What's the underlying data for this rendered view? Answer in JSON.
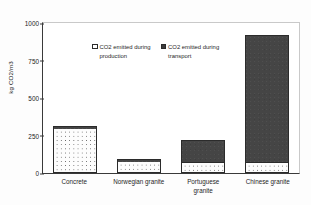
{
  "chart_data": {
    "type": "bar",
    "subtype": "stacked-vertical",
    "title": "",
    "xlabel": "",
    "ylabel": "kg CO2/m3",
    "ylim": [
      0,
      1000
    ],
    "yticks": [
      0,
      250,
      500,
      750,
      1000
    ],
    "ytick_labels": [
      "0",
      "250",
      "500",
      "750",
      "1000"
    ],
    "grid": false,
    "legend_position": "inside-top-left",
    "categories": [
      "Concrete",
      "Norwegian granite",
      "Portuguese granite",
      "Chinese granite"
    ],
    "category_lines": [
      [
        "Concrete"
      ],
      [
        "Norwegian granite"
      ],
      [
        "Portuguese",
        "granite"
      ],
      [
        "Chinese granite"
      ]
    ],
    "series": [
      {
        "name": "CO2 emitted during production",
        "swatch": "production",
        "color": "#ffffff",
        "values": [
          290,
          70,
          70,
          70
        ]
      },
      {
        "name": "CO2 emitted during transport",
        "swatch": "transport",
        "color": "#3c3c3c",
        "values": [
          12,
          12,
          135,
          835
        ]
      }
    ],
    "totals": [
      302,
      82,
      205,
      905
    ]
  },
  "legend": {
    "entries": [
      {
        "label_line1": "CO2 emitted during",
        "label_line2": "production",
        "swatch": "production"
      },
      {
        "label_line1": "CO2 emitted during",
        "label_line2": "transport",
        "swatch": "transport"
      }
    ]
  },
  "colors": {
    "production_fill": "#ffffff",
    "transport_fill": "#3c3c3c",
    "axis": "#3a3a3a",
    "background": "#fdfdfd"
  }
}
